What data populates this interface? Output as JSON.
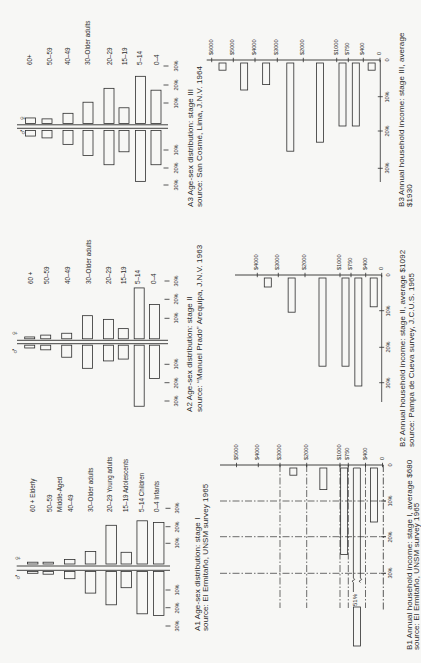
{
  "colors": {
    "paper": "#f7f7f5",
    "ink": "#2e2e2e"
  },
  "chart_data": [
    {
      "id": "A1",
      "type": "bar",
      "variant": "population-pyramid",
      "caption_lines": [
        "A1 Age-sex distribution: stage I",
        "source: El Ermitaño, UNSM survey 1965"
      ],
      "categories": [
        "60 + Elderly",
        "50–59",
        "40–49",
        "30–Older adults",
        "20–29 Young adults",
        "15–19 Adolescents",
        "5–14 Children",
        "0–4 Infants"
      ],
      "annotations": [
        "Middle-Aged"
      ],
      "series": [
        {
          "name": "female",
          "symbol": "♀",
          "values": [
            1,
            1,
            2.5,
            7,
            21.5,
            6.5,
            24,
            23
          ]
        },
        {
          "name": "male",
          "symbol": "♂",
          "values": [
            1,
            1.5,
            4,
            12,
            18.5,
            9,
            23.5,
            24.5
          ]
        }
      ],
      "tick_labels_female": [
        "10%",
        "20%",
        "30%"
      ],
      "tick_labels_male": [
        "10%",
        "20%",
        "30%"
      ],
      "xlim": [
        0,
        30
      ],
      "unit": "%",
      "grid": false
    },
    {
      "id": "A2",
      "type": "bar",
      "variant": "population-pyramid",
      "caption_lines": [
        "A2 Age-sex distribution: stage II",
        "source: “Manuel Prado” Arequipa, J.N.V. 1963"
      ],
      "categories": [
        "60 +",
        "50–59",
        "40–49",
        "30–Older adults",
        "20–29",
        "15–19",
        "5–14",
        "0–4"
      ],
      "series": [
        {
          "name": "female",
          "symbol": "♀",
          "values": [
            1,
            2,
            3,
            12.5,
            10.5,
            5.5,
            27.5,
            18.5
          ]
        },
        {
          "name": "male",
          "symbol": "♂",
          "values": [
            1.5,
            2.5,
            6.5,
            12.5,
            8.5,
            7.5,
            33,
            18
          ]
        }
      ],
      "tick_labels_female": [
        "10%",
        "20%",
        "30%"
      ],
      "tick_labels_male": [
        "10%",
        "20%",
        "30%"
      ],
      "xlim": [
        0,
        30
      ],
      "unit": "%",
      "grid": false
    },
    {
      "id": "A3",
      "type": "bar",
      "variant": "population-pyramid",
      "caption_lines": [
        "A3 Age-sex distribution: stage III",
        "source: San Cosmé, Lima, J.N.V. 1964"
      ],
      "categories": [
        "60+",
        "50–59",
        "40–49",
        "30–Older adults",
        "20–29",
        "15–19",
        "5–14",
        "0–4"
      ],
      "series": [
        {
          "name": "female",
          "symbol": "♀",
          "values": [
            3,
            2.5,
            5.5,
            11.5,
            19,
            8.5,
            25.5,
            18
          ]
        },
        {
          "name": "male",
          "symbol": "♂",
          "values": [
            3,
            4,
            7.5,
            13.5,
            18.5,
            11.5,
            27.5,
            18.5
          ]
        }
      ],
      "tick_labels_female": [
        "10%",
        "20%",
        "30%"
      ],
      "tick_labels_male": [
        "10%",
        "20%",
        "30%"
      ],
      "xlim": [
        0,
        30
      ],
      "unit": "%",
      "grid": false
    },
    {
      "id": "B1",
      "type": "bar",
      "caption_lines": [
        "B1 Annual household income: stage I, average $680",
        "source: El Ermitaño, UNSM survey 1965"
      ],
      "income_tick_labels": [
        "$5000",
        "$4000",
        "$3000",
        "$2000",
        "$1000",
        "$750",
        "$400",
        "0"
      ],
      "categories": [
        "$5000–$4000",
        "$4000–$3000",
        "$3000–$2000",
        "$2000–$1000",
        "$1000–$750",
        "$750–$400",
        "$400–0"
      ],
      "values": [
        0,
        0,
        2,
        6,
        24,
        51,
        15
      ],
      "percent_tick_labels": [
        "0",
        "10%",
        "20%",
        "30%"
      ],
      "annotations": [
        "51%"
      ],
      "xlim": [
        0,
        30
      ],
      "unit": "%",
      "grid": true
    },
    {
      "id": "B2",
      "type": "bar",
      "caption_lines": [
        "B2 Annual household income: stage II, average $1092",
        "source: Pampa de Cueva survey, J.C.U.S. 1965"
      ],
      "income_tick_labels": [
        "$4000",
        "$3000",
        "$2000",
        "$1000",
        "$750",
        "$400",
        "0"
      ],
      "categories": [
        "$4000–$3000",
        "$3000–$2000",
        "$2000–$1000",
        "$1000–$750",
        "$750–$400",
        "$400–0"
      ],
      "values": [
        2.5,
        9.5,
        24.5,
        24.5,
        30,
        8
      ],
      "percent_tick_labels": [
        "0",
        "10%",
        "20%",
        "30%"
      ],
      "xlim": [
        0,
        30
      ],
      "unit": "%",
      "grid": false
    },
    {
      "id": "B3",
      "type": "bar",
      "caption_lines": [
        "B3 Annual household income: stage III, average",
        "$1930"
      ],
      "income_tick_labels": [
        "$6000",
        "$5000",
        "$4000",
        "$3000",
        "$2000",
        "$1000",
        "$750",
        "$400",
        "0"
      ],
      "categories": [
        "$6000–$5000",
        "$5000–$4000",
        "$4000–$3000",
        "$3000–$2000",
        "$2000–$1000",
        "$1000–$750",
        "$750–$400",
        "$400–0"
      ],
      "values": [
        2,
        7.5,
        6,
        24.5,
        22,
        17.5,
        17.5,
        2
      ],
      "percent_tick_labels": [
        "0",
        "10%",
        "20%",
        "30%"
      ],
      "xlim": [
        0,
        30
      ],
      "unit": "%",
      "grid": false
    }
  ]
}
